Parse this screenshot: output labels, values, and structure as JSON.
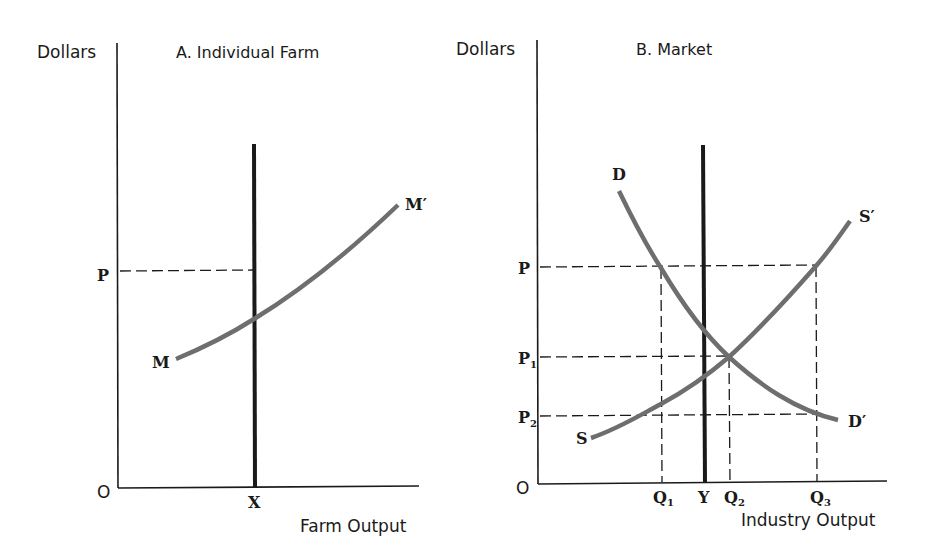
{
  "panels": [
    {
      "id": "A",
      "title": "A. Individual Farm",
      "y_axis_label": "Dollars",
      "x_axis_label": "Farm Output",
      "origin_label": "O",
      "price_labels": {
        "p": "P"
      },
      "quantity_labels": {
        "x": "X"
      },
      "curve_labels": {
        "start": "M",
        "end": "M′"
      }
    },
    {
      "id": "B",
      "title": "B. Market",
      "y_axis_label": "Dollars",
      "x_axis_label": "Industry Output",
      "origin_label": "O",
      "price_labels": {
        "p": "P",
        "p1": "P",
        "p1_sub": "1",
        "p2": "P",
        "p2_sub": "2"
      },
      "quantity_labels": {
        "q1": "Q",
        "q1_sub": "1",
        "y": "Y",
        "q2": "Q",
        "q2_sub": "2",
        "q3": "Q",
        "q3_sub": "3"
      },
      "curve_labels": {
        "demand_start": "D",
        "demand_end": "D′",
        "supply_start": "S",
        "supply_end": "S′"
      }
    }
  ],
  "colors": {
    "axis": "#1a1a1a",
    "curve": "#6e6e6e",
    "fixed_output_line": "#1a1a1a",
    "guide_dash": "#1a1a1a"
  }
}
